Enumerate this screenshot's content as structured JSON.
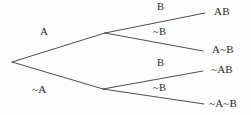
{
  "diagram": {
    "type": "binary-probability-tree",
    "line_color": "#3a3a3a",
    "text_color": "#2b2b2b",
    "background_color": "#fdfdfd",
    "first_level": {
      "top_label": "A",
      "bottom_label": "~A"
    },
    "second_level": {
      "top_branch_b": "B",
      "top_branch_not_b": "~B",
      "bottom_branch_b": "B",
      "bottom_branch_not_b": "~B"
    },
    "outcomes": [
      {
        "label": "AB"
      },
      {
        "label": "A~B"
      },
      {
        "label": "~AB"
      },
      {
        "label": "~A~B"
      }
    ]
  }
}
